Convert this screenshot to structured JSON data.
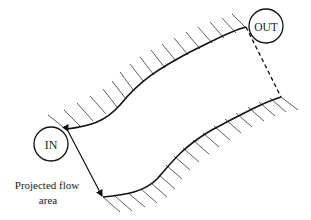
{
  "diagram": {
    "inlet_label": "IN",
    "outlet_label": "OUT",
    "annotation": {
      "line1": "Projected flow",
      "line2": "area"
    },
    "colors": {
      "stroke": "#111111",
      "hatch": "#333333",
      "background": "#ffffff"
    }
  }
}
